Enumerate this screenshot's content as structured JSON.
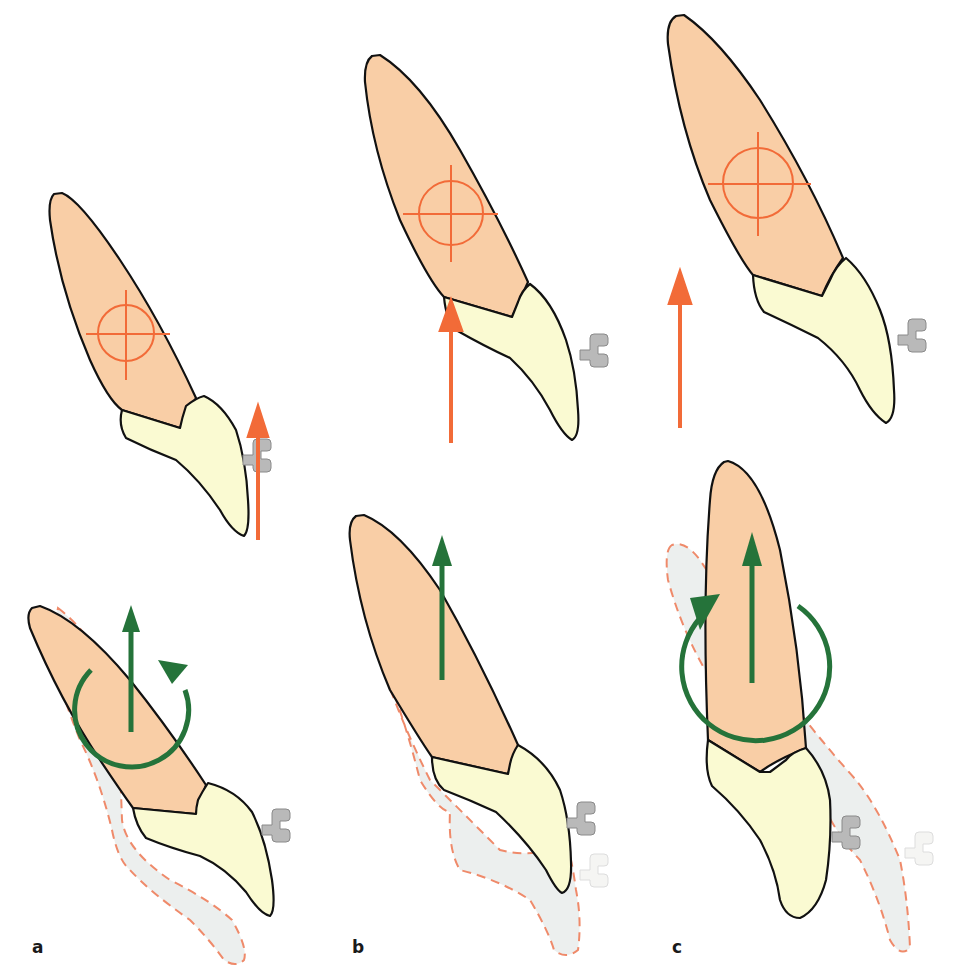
{
  "figure": {
    "colors": {
      "root": "#f9cea6",
      "crown": "#fafad2",
      "outline": "#111111",
      "center_of_resistance": "#f26b38",
      "applied_force_arrow": "#f26b38",
      "movement_arrow": "#25733a",
      "original_position_fill": "#ecefee",
      "original_position_outline": "#ef8a6a",
      "bracket": "#b9b9b9"
    },
    "panels": [
      {
        "label": "a",
        "top": {
          "offset": [
            0,
            0
          ],
          "cres": {
            "cx": 126,
            "cy": 333,
            "r": 28
          },
          "force_arrow": {
            "x": 258,
            "y1": 540,
            "y2": 408,
            "position": "labial to tooth"
          }
        },
        "bottom": {
          "movement": "extrusion with rotation (tipping)",
          "linear_arrow": {
            "x": 131,
            "y1": 732,
            "y2": 605
          },
          "rotation": "counterclockwise arc, arrowhead top right"
        }
      },
      {
        "label": "b",
        "top": {
          "cres": {
            "cx": 451,
            "cy": 213,
            "r": 32
          },
          "force_arrow": {
            "x": 451,
            "y1": 443,
            "y2": 302,
            "position": "through center of resistance"
          }
        },
        "bottom": {
          "movement": "pure extrusion (translation)",
          "linear_arrow": {
            "x": 442,
            "y1": 680,
            "y2": 535
          },
          "rotation": "none"
        }
      },
      {
        "label": "c",
        "top": {
          "cres": {
            "cx": 758,
            "cy": 183,
            "r": 35
          },
          "force_arrow": {
            "x": 680,
            "y1": 428,
            "y2": 273,
            "position": "lingual to tooth"
          }
        },
        "bottom": {
          "movement": "extrusion with rotation (opposite tipping)",
          "linear_arrow": {
            "x": 752,
            "y1": 683,
            "y2": 532
          },
          "rotation": "clockwise arc, arrowhead top left"
        }
      }
    ]
  },
  "labels": {
    "a": "a",
    "b": "b",
    "c": "c"
  }
}
